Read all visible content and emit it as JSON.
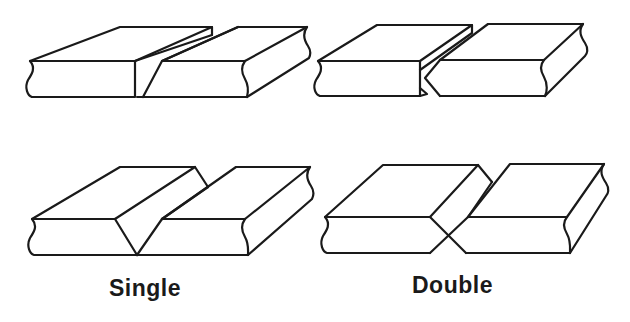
{
  "diagram": {
    "columns": [
      {
        "id": "single",
        "label": "Single"
      },
      {
        "id": "double",
        "label": "Double"
      }
    ],
    "rows": [
      {
        "id": "bevel",
        "description": "bevel groove (one plate edge beveled)"
      },
      {
        "id": "v",
        "description": "V groove (both plate edges beveled)"
      }
    ],
    "figures": [
      {
        "row": "bevel",
        "column": "single",
        "shape": "single-bevel butt joint"
      },
      {
        "row": "bevel",
        "column": "double",
        "shape": "double-bevel butt joint"
      },
      {
        "row": "v",
        "column": "single",
        "shape": "single-V butt joint"
      },
      {
        "row": "v",
        "column": "double",
        "shape": "double-V butt joint"
      }
    ],
    "colors": {
      "line": "#1a1a1a",
      "background": "#ffffff"
    }
  },
  "labels": {
    "single": "Single",
    "double": "Double"
  }
}
